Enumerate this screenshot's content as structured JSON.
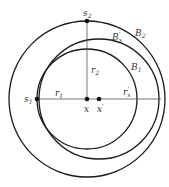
{
  "diagram": {
    "type": "geometric-circles",
    "colors": {
      "stroke": "#1a1a1a",
      "line": "#555555",
      "text": "#333333",
      "background": "#ffffff"
    },
    "points": [
      {
        "id": "s2",
        "label": "s",
        "sub": "2",
        "x": 87,
        "y": 21
      },
      {
        "id": "s1",
        "label": "s",
        "sub": "1",
        "x": 37,
        "y": 99
      },
      {
        "id": "x",
        "label": "x",
        "x": 87,
        "y": 99
      },
      {
        "id": "xprime",
        "label": "x",
        "sup": "'",
        "x": 99,
        "y": 99
      }
    ],
    "circles": [
      {
        "id": "B2",
        "label": "B",
        "sub": "2",
        "cx": 87,
        "cy": 99,
        "r": 78
      },
      {
        "id": "B1",
        "label": "B",
        "sub": "1",
        "cx": 87,
        "cy": 99,
        "r": 50
      },
      {
        "id": "B1prime",
        "label": "B",
        "sub": "x",
        "sup": "'",
        "cx": 99,
        "cy": 99,
        "r": 60
      }
    ],
    "segments": [
      {
        "id": "r1",
        "label": "r",
        "sub": "1"
      },
      {
        "id": "r2",
        "label": "r",
        "sub": "2"
      },
      {
        "id": "rxprime",
        "label": "r",
        "sub": "x",
        "sup": "'"
      }
    ],
    "labels": {
      "s2": "s",
      "s2_sub": "2",
      "s1": "s",
      "s1_sub": "1",
      "x": "x",
      "xprime": "x",
      "xprime_sup": "'",
      "r1": "r",
      "r1_sub": "1",
      "r2": "r",
      "r2_sub": "2",
      "rx": "r",
      "rx_sub": "x",
      "rx_sup": "'",
      "B1": "B",
      "B1_sub": "1",
      "B2": "B",
      "B2_sub": "2",
      "Bx": "B",
      "Bx_sub": "x",
      "Bx_sup": "'"
    }
  }
}
